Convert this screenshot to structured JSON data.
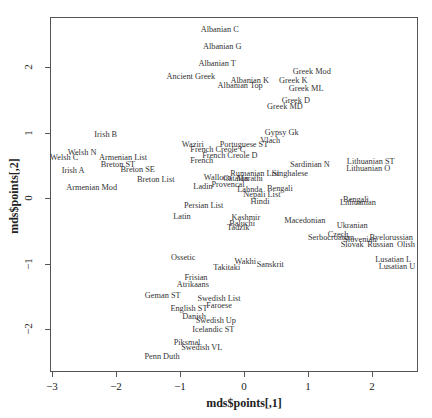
{
  "chart_data": {
    "type": "scatter",
    "title": "",
    "xlabel": "mds$points[,1]",
    "ylabel": "mds$points[,2]",
    "xlim": [
      -3,
      2.7
    ],
    "ylim": [
      -2.65,
      2.75
    ],
    "xticks": [
      -3,
      -2,
      -1,
      0,
      1,
      2
    ],
    "yticks": [
      -2,
      -1,
      0,
      1,
      2
    ],
    "xtick_labels": [
      "−3",
      "−2",
      "−1",
      "0",
      "1",
      "2"
    ],
    "ytick_labels": [
      "−2",
      "−1",
      "0",
      "1",
      "2"
    ],
    "grid": false,
    "legend": null,
    "marker": "text-label",
    "points": [
      {
        "label": "Albanian C",
        "x": -0.38,
        "y": 2.56
      },
      {
        "label": "Albanian G",
        "x": -0.34,
        "y": 2.31
      },
      {
        "label": "Albanian T",
        "x": -0.42,
        "y": 2.05
      },
      {
        "label": "Ancient Greek",
        "x": -0.83,
        "y": 1.85
      },
      {
        "label": "Albanian K",
        "x": 0.09,
        "y": 1.79
      },
      {
        "label": "Greek K",
        "x": 0.77,
        "y": 1.79
      },
      {
        "label": "Albanian Top",
        "x": -0.06,
        "y": 1.71
      },
      {
        "label": "Greek Mod",
        "x": 1.06,
        "y": 1.92
      },
      {
        "label": "Greek ML",
        "x": 0.97,
        "y": 1.66
      },
      {
        "label": "Greek D",
        "x": 0.81,
        "y": 1.48
      },
      {
        "label": "Greek MD",
        "x": 0.64,
        "y": 1.39
      },
      {
        "label": "Irish B",
        "x": -2.16,
        "y": 0.96
      },
      {
        "label": "Welsh N",
        "x": -2.53,
        "y": 0.69
      },
      {
        "label": "Welsh C",
        "x": -2.81,
        "y": 0.61
      },
      {
        "label": "Armenian List",
        "x": -1.89,
        "y": 0.61
      },
      {
        "label": "Breton ST",
        "x": -1.97,
        "y": 0.5
      },
      {
        "label": "Breton SE",
        "x": -1.66,
        "y": 0.43
      },
      {
        "label": "Irish A",
        "x": -2.67,
        "y": 0.41
      },
      {
        "label": "Armenian Mod",
        "x": -2.38,
        "y": 0.15
      },
      {
        "label": "Breton List",
        "x": -1.38,
        "y": 0.27
      },
      {
        "label": "Gypsy Gk",
        "x": 0.59,
        "y": 0.99
      },
      {
        "label": "Vlach",
        "x": 0.41,
        "y": 0.87
      },
      {
        "label": "Waziri",
        "x": -0.8,
        "y": 0.81
      },
      {
        "label": "Portuguese ST",
        "x": 0.0,
        "y": 0.81
      },
      {
        "label": "French Creole C",
        "x": -0.41,
        "y": 0.73
      },
      {
        "label": "French Creole D",
        "x": -0.22,
        "y": 0.64
      },
      {
        "label": "French",
        "x": -0.66,
        "y": 0.56
      },
      {
        "label": "Sardinian N",
        "x": 1.03,
        "y": 0.5
      },
      {
        "label": "Lithuanian ST",
        "x": 1.98,
        "y": 0.55
      },
      {
        "label": "Lithuanian O",
        "x": 1.94,
        "y": 0.44
      },
      {
        "label": "Singhalese",
        "x": 0.72,
        "y": 0.37
      },
      {
        "label": "Walloon",
        "x": -0.41,
        "y": 0.31
      },
      {
        "label": "Catalan",
        "x": -0.13,
        "y": 0.29
      },
      {
        "label": "Marathi",
        "x": 0.09,
        "y": 0.29
      },
      {
        "label": "Rumanian List",
        "x": 0.17,
        "y": 0.37
      },
      {
        "label": "Ladin",
        "x": -0.64,
        "y": 0.17
      },
      {
        "label": "Provencal",
        "x": -0.25,
        "y": 0.2
      },
      {
        "label": "Lahnda",
        "x": 0.09,
        "y": 0.12
      },
      {
        "label": "Bengali",
        "x": 0.56,
        "y": 0.14
      },
      {
        "label": "Nepali List",
        "x": 0.28,
        "y": 0.05
      },
      {
        "label": "Hindi",
        "x": 0.25,
        "y": -0.06
      },
      {
        "label": "Persian List",
        "x": -0.63,
        "y": -0.12
      },
      {
        "label": "Latin",
        "x": -0.97,
        "y": -0.29
      },
      {
        "label": "Kashmir",
        "x": 0.03,
        "y": -0.31
      },
      {
        "label": "Baluchi",
        "x": -0.03,
        "y": -0.4
      },
      {
        "label": "Tadzik",
        "x": -0.09,
        "y": -0.46
      },
      {
        "label": "Macedonian",
        "x": 0.95,
        "y": -0.35
      },
      {
        "label": "Bengali",
        "x": 1.75,
        "y": -0.03
      },
      {
        "label": "Lithuanian",
        "x": 1.78,
        "y": -0.08
      },
      {
        "label": "Ukranian",
        "x": 1.69,
        "y": -0.43
      },
      {
        "label": "Czech",
        "x": 1.47,
        "y": -0.56
      },
      {
        "label": "Serbocroatian",
        "x": 1.36,
        "y": -0.61
      },
      {
        "label": "Slovenian",
        "x": 1.81,
        "y": -0.64
      },
      {
        "label": "Byelorussian",
        "x": 2.3,
        "y": -0.61
      },
      {
        "label": "Slovak",
        "x": 1.69,
        "y": -0.72
      },
      {
        "label": "Russian",
        "x": 2.13,
        "y": -0.72
      },
      {
        "label": "Olish",
        "x": 2.53,
        "y": -0.72
      },
      {
        "label": "Lusatian L",
        "x": 2.33,
        "y": -0.95
      },
      {
        "label": "Lusatian U",
        "x": 2.39,
        "y": -1.05
      },
      {
        "label": "Ossetic",
        "x": -0.95,
        "y": -0.92
      },
      {
        "label": "Wakhi",
        "x": 0.02,
        "y": -0.98
      },
      {
        "label": "Sanskrit",
        "x": 0.41,
        "y": -1.02
      },
      {
        "label": "Takitaki",
        "x": -0.27,
        "y": -1.07
      },
      {
        "label": "Frisian",
        "x": -0.75,
        "y": -1.22
      },
      {
        "label": "Atrikaans",
        "x": -0.8,
        "y": -1.33
      },
      {
        "label": "Geman ST",
        "x": -1.27,
        "y": -1.5
      },
      {
        "label": "Swedish List",
        "x": -0.39,
        "y": -1.54
      },
      {
        "label": "Faroese",
        "x": -0.39,
        "y": -1.65
      },
      {
        "label": "English ST",
        "x": -0.86,
        "y": -1.69
      },
      {
        "label": "Danish",
        "x": -0.78,
        "y": -1.82
      },
      {
        "label": "Swedish Up",
        "x": -0.44,
        "y": -1.88
      },
      {
        "label": "Icelandic ST",
        "x": -0.48,
        "y": -2.02
      },
      {
        "label": "Piksmal",
        "x": -0.89,
        "y": -2.21
      },
      {
        "label": "Swedish VL",
        "x": -0.66,
        "y": -2.29
      },
      {
        "label": "Penn Duth",
        "x": -1.28,
        "y": -2.43
      }
    ]
  },
  "axes": {
    "xlabel": "mds$points[,1]",
    "ylabel": "mds$points[,2]"
  }
}
